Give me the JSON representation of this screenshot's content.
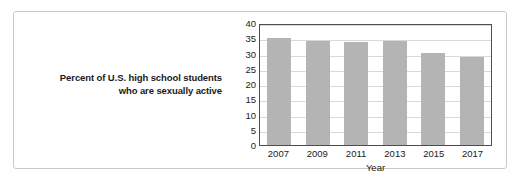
{
  "caption": {
    "line1": "Percent of U.S. high school students",
    "line2": "who are sexually active"
  },
  "chart_data": {
    "type": "bar",
    "title": "",
    "categories": [
      "2007",
      "2009",
      "2011",
      "2013",
      "2015",
      "2017"
    ],
    "values": [
      35.0,
      34.2,
      33.7,
      34.0,
      30.1,
      28.7
    ],
    "xlabel": "Year",
    "ylabel": "",
    "ylim": [
      0,
      40
    ],
    "ytick_step": 5,
    "yticks": [
      "40",
      "35",
      "30",
      "25",
      "20",
      "15",
      "10",
      "5",
      "0"
    ],
    "grid": true,
    "legend": "none",
    "bar_color": "#b4b4b4",
    "axis_color": "#4d4d4d",
    "gridline_color": "#d9d9d9"
  }
}
